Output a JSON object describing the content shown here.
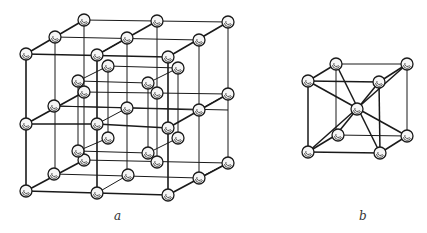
{
  "figure": {
    "panels": [
      {
        "id": "a",
        "label": "a",
        "description": "Face-centered cubic lattice (NaCl-type), 2x2x2 cells"
      },
      {
        "id": "b",
        "label": "b",
        "description": "Body-centered cubic unit cell"
      }
    ],
    "colors": {
      "line": "#1a1a1a",
      "atom_fill": "#f4f4f4",
      "atom_stroke": "#1a1a1a"
    }
  }
}
